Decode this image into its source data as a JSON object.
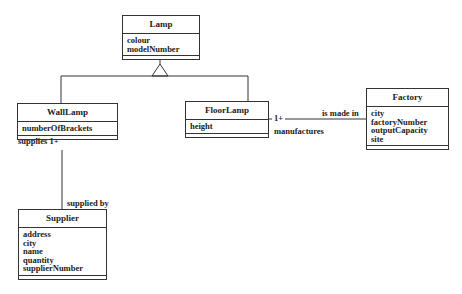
{
  "classes": {
    "lamp": {
      "name": "Lamp",
      "attributes": [
        "colour",
        "modelNumber"
      ]
    },
    "wall_lamp": {
      "name": "WallLamp",
      "attributes": [
        "numberOfBrackets"
      ]
    },
    "floor_lamp": {
      "name": "FloorLamp",
      "attributes": [
        "height"
      ]
    },
    "factory": {
      "name": "Factory",
      "attributes": [
        "city",
        "factoryNumber",
        "outputCapacity",
        "site"
      ]
    },
    "supplier": {
      "name": "Supplier",
      "attributes": [
        "address",
        "city",
        "name",
        "quantity",
        "supplierNumber"
      ]
    }
  },
  "associations": {
    "floorlamp_factory": {
      "multiplicity": "1+",
      "role_forward": "is made in",
      "role_reverse": "manufactures"
    },
    "walllamp_supplier": {
      "role_forward": "supplies 1+",
      "role_reverse": "supplied by"
    }
  },
  "colors": {
    "line": "#333333",
    "text": "#222222",
    "background": "#ffffff"
  }
}
